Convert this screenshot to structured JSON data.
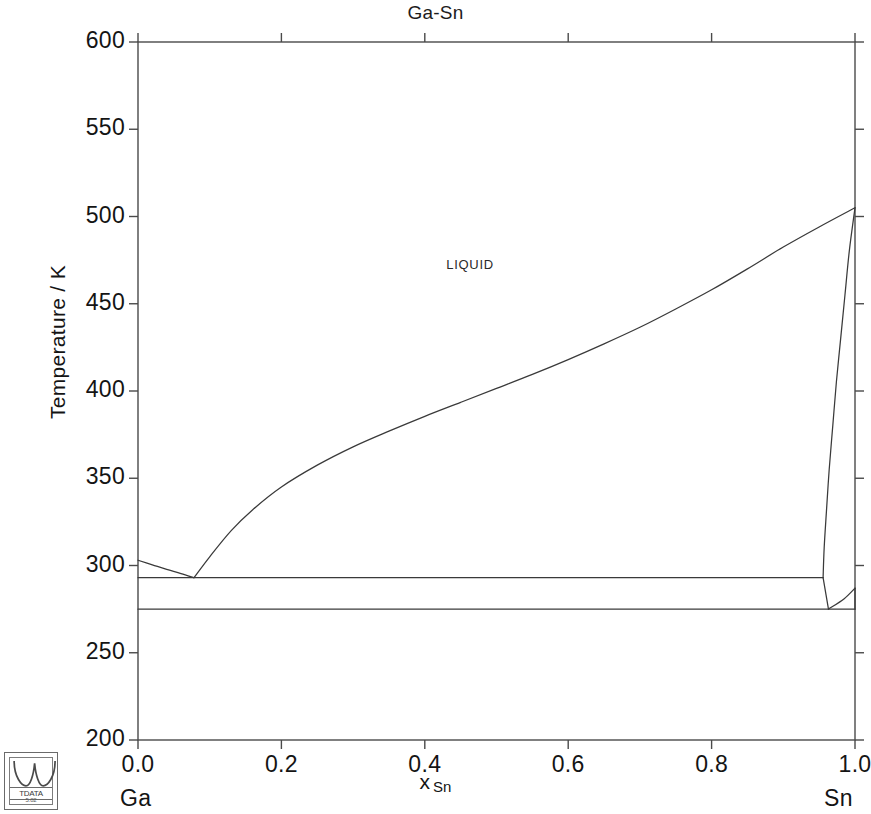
{
  "chart_data": {
    "type": "line",
    "title": "Ga-Sn",
    "subtitle": "",
    "xlabel": "x",
    "xlabel_sub": "Sn",
    "ylabel": "Temperature / K",
    "xlim": [
      0.0,
      1.0
    ],
    "ylim": [
      200,
      600
    ],
    "grid": false,
    "legend_position": "none",
    "xticks": [
      "0.0",
      "0.2",
      "0.4",
      "0.6",
      "0.8",
      "1.0"
    ],
    "xtick_values": [
      0.0,
      0.2,
      0.4,
      0.6,
      0.8,
      1.0
    ],
    "yticks": [
      "200",
      "250",
      "300",
      "350",
      "400",
      "450",
      "500",
      "550",
      "600"
    ],
    "ytick_values": [
      200,
      250,
      300,
      350,
      400,
      450,
      500,
      550,
      600
    ],
    "axis_end_labels": {
      "left": "Ga",
      "right": "Sn"
    },
    "annotations": [
      {
        "text": "LIQUID",
        "x": 0.43,
        "y": 472
      }
    ],
    "line_color": "#3a3a3a",
    "axis_color": "#4a4a4a",
    "series": [
      {
        "name": "Ga liquidus (Ga-rich branch)",
        "points": [
          [
            0.0,
            303.0
          ],
          [
            0.02,
            300.4
          ],
          [
            0.04,
            297.8
          ],
          [
            0.06,
            295.4
          ],
          [
            0.078,
            293.0
          ]
        ]
      },
      {
        "name": "Sn liquidus (Sn-rich branch)",
        "points": [
          [
            0.078,
            293.0
          ],
          [
            0.1,
            305.0
          ],
          [
            0.13,
            320.0
          ],
          [
            0.16,
            332.0
          ],
          [
            0.2,
            345.0
          ],
          [
            0.25,
            357.5
          ],
          [
            0.3,
            368.0
          ],
          [
            0.35,
            377.0
          ],
          [
            0.4,
            385.5
          ],
          [
            0.45,
            393.5
          ],
          [
            0.5,
            401.5
          ],
          [
            0.55,
            409.5
          ],
          [
            0.6,
            418.0
          ],
          [
            0.65,
            427.0
          ],
          [
            0.7,
            436.5
          ],
          [
            0.75,
            447.0
          ],
          [
            0.8,
            458.0
          ],
          [
            0.85,
            470.0
          ],
          [
            0.9,
            482.5
          ],
          [
            0.95,
            494.0
          ],
          [
            1.0,
            505.0
          ]
        ]
      },
      {
        "name": "Sn solidus / solvus (bct-Sn boundary)",
        "points": [
          [
            1.0,
            505.0
          ],
          [
            0.992,
            480.0
          ],
          [
            0.986,
            455.0
          ],
          [
            0.98,
            430.0
          ],
          [
            0.974,
            405.0
          ],
          [
            0.969,
            380.0
          ],
          [
            0.964,
            355.0
          ],
          [
            0.96,
            330.0
          ],
          [
            0.957,
            310.0
          ],
          [
            0.9555,
            293.0
          ]
        ]
      },
      {
        "name": "Ga-rich eutectic horizontal (293 K)",
        "points": [
          [
            0.0,
            293.0
          ],
          [
            0.9555,
            293.0
          ]
        ]
      },
      {
        "name": "Lower invariant horizontal (275 K)",
        "points": [
          [
            0.0,
            275.0
          ],
          [
            1.0,
            275.0
          ]
        ]
      },
      {
        "name": "Sn-rich boundary to lower invariant",
        "points": [
          [
            0.9555,
            293.0
          ],
          [
            0.963,
            275.0
          ]
        ]
      },
      {
        "name": "Sn-rich solvus to right edge",
        "points": [
          [
            0.963,
            275.0
          ],
          [
            0.985,
            281.0
          ],
          [
            1.0,
            287.0
          ]
        ]
      },
      {
        "name": "Right edge segment (Sn terminal solid)",
        "points": [
          [
            1.0,
            287.0
          ],
          [
            1.0,
            275.0
          ]
        ]
      }
    ]
  },
  "logo": {
    "name": "TDATA",
    "word": "TDATA",
    "version": "5.02"
  }
}
